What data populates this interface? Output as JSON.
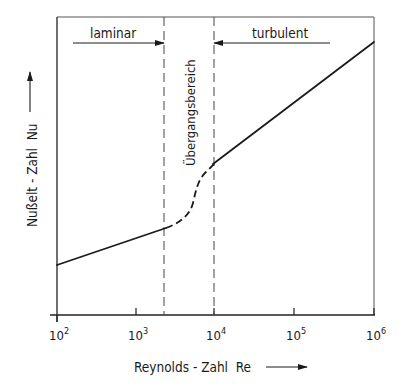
{
  "diagram": {
    "x_axis": {
      "label": "Reynolds - Zahl  Re",
      "scale": "log",
      "ticks": [
        {
          "base": "10",
          "exp": "2"
        },
        {
          "base": "10",
          "exp": "3"
        },
        {
          "base": "10",
          "exp": "4"
        },
        {
          "base": "10",
          "exp": "5"
        },
        {
          "base": "10",
          "exp": "6"
        }
      ]
    },
    "y_axis": {
      "label": "Nußelt - Zahl  Nu"
    },
    "regions": {
      "laminar": "laminar",
      "transition": "Übergangsbereich",
      "turbulent": "turbulent"
    },
    "boundaries": {
      "laminar_end_Re": 2300,
      "turbulent_start_Re": 10000
    },
    "colors": {
      "line": "#1a1a1a",
      "frame": "#555555",
      "dash": "#444444"
    }
  }
}
